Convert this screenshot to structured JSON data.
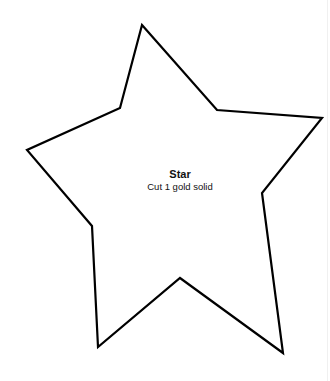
{
  "shape": {
    "name": "Star",
    "instruction": "Cut 1 gold solid",
    "outline_color": "#000000",
    "points": [
      [
        142,
        25
      ],
      [
        217,
        110
      ],
      [
        322,
        118
      ],
      [
        262,
        193
      ],
      [
        283,
        353
      ],
      [
        180,
        278
      ],
      [
        98,
        347
      ],
      [
        92,
        226
      ],
      [
        27,
        150
      ],
      [
        120,
        108
      ]
    ]
  }
}
